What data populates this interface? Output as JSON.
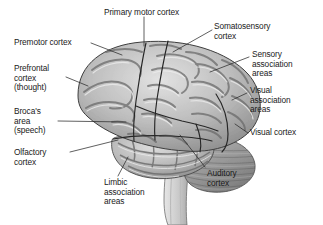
{
  "figure": {
    "background_color": "#ffffff",
    "text_color": "#1a1a1a",
    "leader_line_color": "#2b2b2b",
    "brain_fill_light": "#d8d8d8",
    "brain_fill_mid": "#a9a9a9",
    "brain_fill_dark": "#6e6e6e",
    "brainstem_fill": "#cfcfcf",
    "cerebellum_fill": "#9a9a9a"
  },
  "labels": {
    "primary_motor_cortex": "Primary motor cortex",
    "somatosensory_cortex": "Somatosensory\ncortex",
    "sensory_association_areas": "Sensory\nassociation\nareas",
    "visual_association_areas": "Visual\nassociation\nareas",
    "visual_cortex": "Visual cortex",
    "auditory_cortex": "Auditory\ncortex",
    "limbic_association_areas": "Limbic\nassociation\nareas",
    "olfactory_cortex": "Olfactory\ncortex",
    "brocas_area": "Broca's\narea\n(speech)",
    "prefrontal_cortex": "Prefrontal\ncortex\n(thought)",
    "premotor_cortex": "Premotor cortex"
  }
}
